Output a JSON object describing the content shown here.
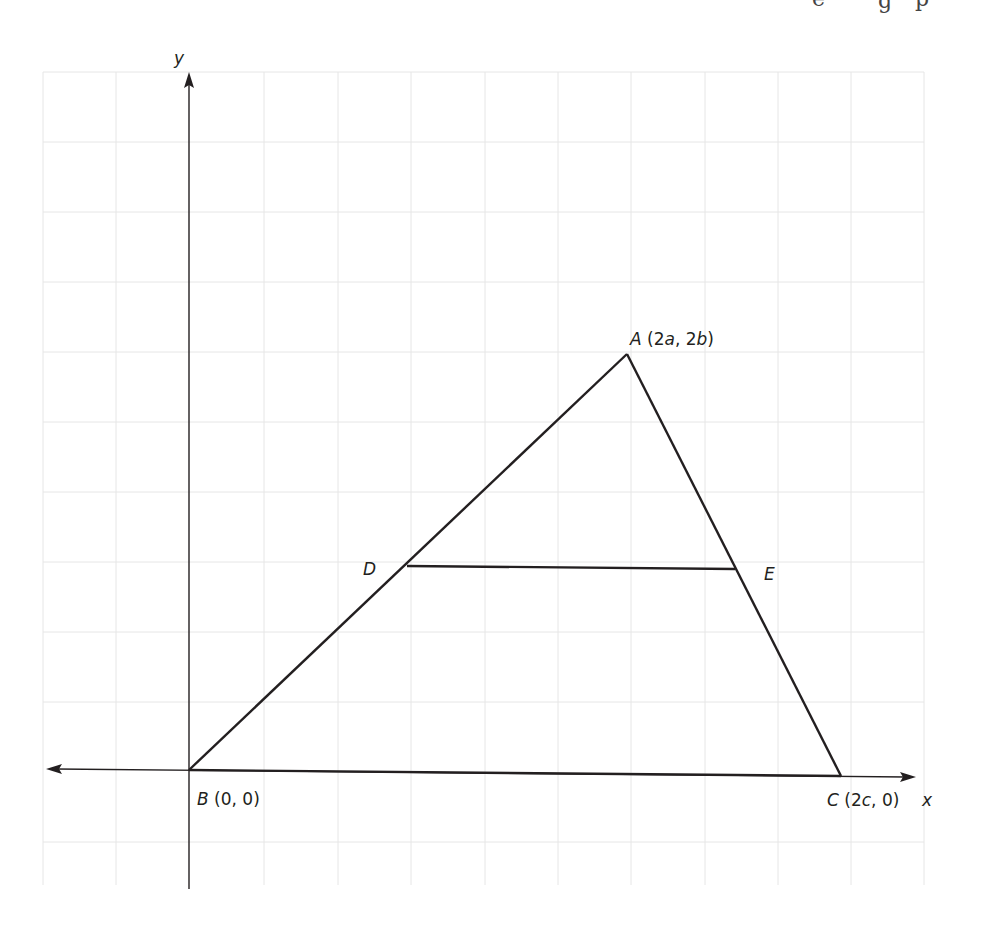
{
  "figure": {
    "type": "coordinate-geometry-diagram",
    "top_cropped_text": "…g g p",
    "axes": {
      "x_label": "x",
      "y_label": "y"
    },
    "points": {
      "A": {
        "name": "A",
        "coords": "(2a, 2b)",
        "italic_parts": [
          "a",
          "b"
        ]
      },
      "B": {
        "name": "B",
        "coords": "(0, 0)"
      },
      "C": {
        "name": "C",
        "coords": "(2c, 0)",
        "italic_parts": [
          "c"
        ]
      },
      "D": {
        "name": "D",
        "coords": ""
      },
      "E": {
        "name": "E",
        "coords": ""
      }
    },
    "segments": [
      "AB",
      "AC",
      "BC",
      "DE"
    ],
    "grid": {
      "columns": 12,
      "rows": 12,
      "color": "#e6e6e6"
    },
    "line_color": "#231f20"
  },
  "labels": {
    "y": "y",
    "x": "x",
    "A_name": "A",
    "A_open": " (2",
    "A_a": "a",
    "A_mid": ", 2",
    "A_b": "b",
    "A_close": ")",
    "B_name": "B",
    "B_coords": " (0, 0)",
    "C_name": "C",
    "C_open": " (2",
    "C_c": "c",
    "C_close": ", 0)",
    "D": "D",
    "E": "E"
  }
}
